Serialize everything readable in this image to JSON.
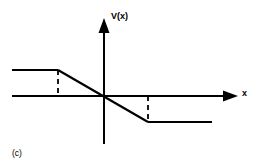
{
  "figure": {
    "caption": "(c)",
    "background_color": "#ffffff",
    "stroke_color": "#000000"
  },
  "labels": {
    "y_axis": "V(x)",
    "x_axis": "x"
  },
  "chart_data": {
    "type": "line",
    "title": "",
    "subtitle": "",
    "xlabel": "x",
    "ylabel": "V(x)",
    "annotations": [
      "(c)"
    ],
    "grid": false,
    "legend": null,
    "axes": {
      "origin_px": [
        104,
        96
      ],
      "x_axis_from_px": [
        12,
        96
      ],
      "x_axis_to_px": [
        238,
        96
      ],
      "y_axis_from_px": [
        104,
        144
      ],
      "y_axis_to_px": [
        104,
        18
      ],
      "x_arrow": true,
      "y_arrow": true,
      "tick_labels_x": [],
      "tick_labels_y": []
    },
    "series": [
      {
        "name": "V(x)",
        "points_px": [
          [
            12,
            70
          ],
          [
            58,
            70
          ],
          [
            104,
            96
          ],
          [
            148,
            122
          ],
          [
            212,
            122
          ]
        ],
        "segments": [
          {
            "name": "left-plateau",
            "from_px": [
              12,
              70
            ],
            "to_px": [
              58,
              70
            ],
            "style": "solid"
          },
          {
            "name": "ramp",
            "from_px": [
              58,
              70
            ],
            "to_px": [
              148,
              122
            ],
            "style": "solid"
          },
          {
            "name": "right-plateau",
            "from_px": [
              148,
              122
            ],
            "to_px": [
              212,
              122
            ],
            "style": "solid"
          }
        ]
      }
    ],
    "guides": [
      {
        "name": "left-dashed-guide",
        "from_px": [
          58,
          70
        ],
        "to_px": [
          58,
          96
        ],
        "style": "dashed"
      },
      {
        "name": "right-dashed-guide",
        "from_px": [
          148,
          96
        ],
        "to_px": [
          148,
          122
        ],
        "style": "dashed"
      }
    ]
  }
}
